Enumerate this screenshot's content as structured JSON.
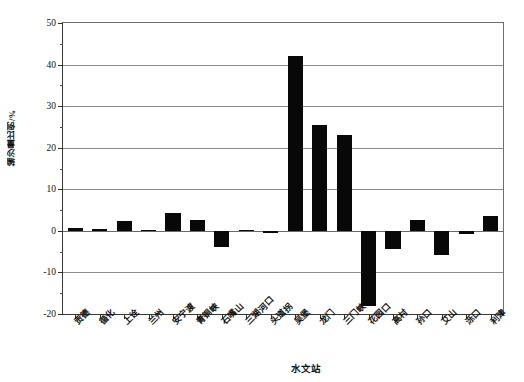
{
  "chart_data": {
    "type": "bar",
    "title": "",
    "xlabel": "水文站",
    "ylabel": "输沙量比例/%",
    "ylim": [
      -20,
      50
    ],
    "ytick_step": 10,
    "yticks": [
      "50",
      "40",
      "30",
      "20",
      "10",
      "0",
      "-10",
      "-20"
    ],
    "grid": "horizontal",
    "legend": "none",
    "bar_color": "#080808",
    "categories": [
      "贡德",
      "循化",
      "上诠",
      "兰州",
      "安宁渡",
      "青铜峡",
      "石嘴山",
      "三湖河口",
      "头道拐",
      "吴堡",
      "龙门",
      "三门峡",
      "花园口",
      "高村",
      "孙口",
      "艾山",
      "泺口",
      "利津"
    ],
    "values": [
      0.6,
      0.5,
      2.4,
      0.2,
      4.3,
      2.5,
      -3.8,
      0.1,
      -0.5,
      42.0,
      25.5,
      23.0,
      -18.0,
      -4.3,
      2.6,
      -5.8,
      -0.8,
      3.5
    ]
  }
}
